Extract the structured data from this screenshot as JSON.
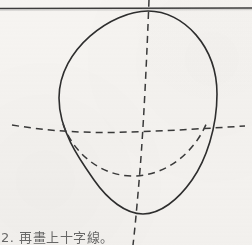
{
  "page": {
    "background_color": "#f6f4f1",
    "width": 252,
    "height": 245
  },
  "caption": {
    "text": "2. 再畫上十字線。",
    "step_number": "2",
    "color": "#4a4a4a"
  },
  "figure": {
    "name": "head-construction-diagram",
    "solid_color": "#2e2e2e",
    "dashed_color": "#3a3a3a",
    "rule_color": "#3c3c3c",
    "solid_stroke_width": 1.6,
    "dashed_stroke_width": 1.5,
    "rule_stroke_width": 1.5,
    "dash_pattern": "7 5",
    "elements": [
      {
        "id": "ruled-line",
        "label": "horizontal ruled paper line",
        "type": "line",
        "x1": 0,
        "y1": 8.5,
        "x2": 252,
        "y2": 8.0
      },
      {
        "id": "head-outline",
        "label": "egg shaped head outline",
        "type": "closed-path",
        "top": {
          "x": 148,
          "y": 11
        },
        "bottom": {
          "x": 143,
          "y": 214
        },
        "left": {
          "x": 59,
          "y": 104
        },
        "right": {
          "x": 217,
          "y": 108
        },
        "path": "M 148 11 C 184 11 217 47 217 94 C 217 128 206 160 192 180 C 178 200 160 214 143 214 C 126 214 108 200 94 180 C 80 160 59 131 59 98 C 59 49 112 11 148 11 Z"
      },
      {
        "id": "vertical-centre-line",
        "label": "dashed vertical centre line",
        "type": "dashed-path",
        "path": "M 149 0 C 147 52 144 120 140 170 C 137 206 135 228 133 245"
      },
      {
        "id": "horizontal-eye-line",
        "label": "dashed horizontal eye line",
        "type": "dashed-path",
        "path": "M 12 125 C 60 133 100 133 130 132 C 170 131 212 128 245 126"
      },
      {
        "id": "lower-jaw-curve",
        "label": "dashed lower jaw construction curve",
        "type": "dashed-path",
        "path": "M 63 124 C 72 150 98 176 133 176 C 168 176 196 150 207 122"
      }
    ]
  }
}
